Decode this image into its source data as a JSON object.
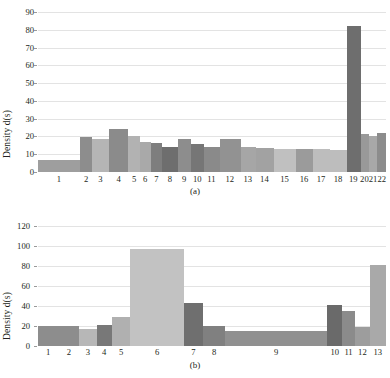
{
  "figure": {
    "panels": [
      {
        "id": "a",
        "caption": "(a)",
        "ylabel": "Density d(s)"
      },
      {
        "id": "b",
        "caption": "(b)",
        "ylabel": "Density d(s)"
      }
    ]
  },
  "chart_data": [
    {
      "type": "bar",
      "panel": "(a)",
      "title": "",
      "xlabel": "",
      "ylabel": "Density d(s)",
      "ylim": [
        0,
        90
      ],
      "yticks": [
        0,
        10,
        20,
        30,
        40,
        50,
        60,
        70,
        80,
        90
      ],
      "grid": true,
      "legend": "none",
      "categories": [
        "1",
        "2",
        "3",
        "4",
        "5",
        "6",
        "7",
        "8",
        "9",
        "10",
        "11",
        "12",
        "13",
        "14",
        "15",
        "16",
        "17",
        "18",
        "19",
        "20",
        "21",
        "22"
      ],
      "values": [
        7,
        19.5,
        18.5,
        24,
        20.5,
        17,
        16.5,
        14,
        18.5,
        16,
        14,
        18.5,
        14,
        13.5,
        13,
        13,
        12.8,
        12.5,
        82,
        21.5,
        20.5,
        22
      ],
      "widths": [
        2.9,
        0.85,
        1.15,
        1.35,
        0.8,
        0.75,
        0.8,
        1.05,
        0.95,
        0.85,
        1.1,
        1.45,
        1.05,
        1.25,
        1.55,
        1.15,
        1.2,
        1.15,
        0.95,
        0.6,
        0.55,
        0.6
      ],
      "colors": [
        "#9e9e9e",
        "#8d8d8d",
        "#b5b5b5",
        "#8b8b8b",
        "#b2b2b2",
        "#a9a9a9",
        "#7e7e7e",
        "#6e6e6e",
        "#8d8d8d",
        "#767676",
        "#8a8a8a",
        "#929292",
        "#a6a6a6",
        "#a2a2a2",
        "#c0c0c0",
        "#9b9b9b",
        "#bdbdbd",
        "#bdbdbd",
        "#6e6e6e",
        "#999999",
        "#a8a8a8",
        "#8c8c8c"
      ]
    },
    {
      "type": "bar",
      "panel": "(b)",
      "title": "",
      "xlabel": "",
      "ylabel": "Density d(s)",
      "ylim": [
        0,
        120
      ],
      "yticks": [
        0,
        20,
        40,
        60,
        80,
        100,
        120
      ],
      "grid": true,
      "legend": "none",
      "categories": [
        "1",
        "2",
        "3",
        "4",
        "5",
        "6",
        "7",
        "8",
        "9",
        "10",
        "11",
        "12",
        "13"
      ],
      "values": [
        20,
        20,
        17,
        21,
        29,
        97,
        43,
        20,
        15,
        41,
        35,
        19,
        81
      ],
      "widths": [
        1.0,
        1.0,
        0.85,
        0.75,
        0.9,
        2.6,
        0.95,
        1.05,
        5.0,
        0.7,
        0.65,
        0.7,
        0.8
      ],
      "colors": [
        "#8d8d8d",
        "#8d8d8d",
        "#b7b7b7",
        "#787878",
        "#b0b0b0",
        "#c2c2c2",
        "#6f6f6f",
        "#808080",
        "#909090",
        "#6a6a6a",
        "#8b8b8b",
        "#9d9d9d",
        "#a9a9a9"
      ]
    }
  ]
}
